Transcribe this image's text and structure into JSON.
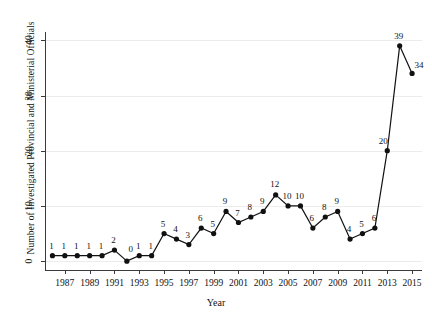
{
  "chart_data": {
    "type": "line",
    "title": "",
    "xlabel": "Year",
    "ylabel": "Number of Investigated Provincial and Ministerial Officials",
    "x": [
      1986,
      1987,
      1988,
      1989,
      1990,
      1991,
      1992,
      1993,
      1994,
      1995,
      1996,
      1997,
      1998,
      1999,
      2000,
      2001,
      2002,
      2003,
      2004,
      2005,
      2006,
      2007,
      2008,
      2009,
      2010,
      2011,
      2012,
      2013,
      2014,
      2015
    ],
    "values": [
      1,
      1,
      1,
      1,
      1,
      2,
      0,
      1,
      1,
      5,
      4,
      3,
      6,
      5,
      9,
      7,
      8,
      9,
      12,
      10,
      10,
      6,
      8,
      9,
      4,
      5,
      6,
      20,
      39,
      34
    ],
    "point_labels": [
      "1",
      "1",
      "1",
      "1",
      "1",
      "2",
      "0",
      "1",
      "1",
      "5",
      "4",
      "3",
      "6",
      "5",
      "9",
      "7",
      "8",
      "9",
      "12",
      "10",
      "10",
      "6",
      "8",
      "9",
      "4",
      "5",
      "6",
      "20",
      "39",
      "34"
    ],
    "xlim": [
      1985.4,
      2015.8
    ],
    "ylim": [
      -1.6,
      41.5
    ],
    "xticks": [
      1987,
      1989,
      1991,
      1993,
      1995,
      1997,
      1999,
      2001,
      2003,
      2005,
      2007,
      2009,
      2011,
      2013,
      2015
    ],
    "xticklabels": [
      "1987",
      "1989",
      "1991",
      "1993",
      "1995",
      "1997",
      "1999",
      "2001",
      "2003",
      "2005",
      "2007",
      "2009",
      "2011",
      "2013",
      "2015"
    ],
    "yticks": [
      0,
      10,
      20,
      30,
      40
    ],
    "yticklabels": [
      "0",
      "10",
      "20",
      "30",
      "40"
    ],
    "grid": "horizontal",
    "legend": "none",
    "line_color": "#111111",
    "marker": "circle",
    "marker_color": "#111111"
  }
}
